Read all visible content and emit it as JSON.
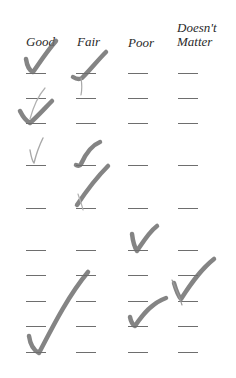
{
  "form": {
    "columns": [
      {
        "label": "Good"
      },
      {
        "label": "Fair"
      },
      {
        "label": "Poor"
      },
      {
        "label_line1": "Doesn't",
        "label_line2": "Matter"
      }
    ],
    "row_count": 10,
    "column_x": [
      26,
      76,
      128,
      178
    ],
    "row_y": [
      73,
      98,
      123,
      165,
      208,
      250,
      275,
      301,
      326,
      352
    ],
    "blank_width": 20
  },
  "colors": {
    "ink": "#2a2a2a",
    "blank_line": "#6e6e6e",
    "check_mark": "#777777",
    "faint_mark": "#a8a8a8"
  },
  "check_marks": [
    {
      "row": 1,
      "column": "Good",
      "style": "bold"
    },
    {
      "row": 1,
      "column": "Fair",
      "style": "bold"
    },
    {
      "row": 3,
      "column": "Good",
      "style": "bold"
    },
    {
      "row": 4,
      "column": "Good",
      "style": "faint"
    },
    {
      "row": 4,
      "column": "Fair",
      "style": "bold"
    },
    {
      "row": 5,
      "column": "Fair",
      "style": "bold"
    },
    {
      "row": 6,
      "column": "Poor",
      "style": "bold"
    },
    {
      "row": 7,
      "column": "Doesn't Matter",
      "style": "bold"
    },
    {
      "row": 9,
      "column": "Poor",
      "style": "bold"
    },
    {
      "row": 10,
      "column": "Good",
      "style": "bold-large"
    }
  ]
}
